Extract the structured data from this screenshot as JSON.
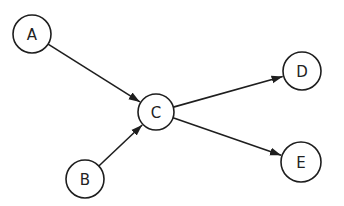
{
  "diagram": {
    "type": "directed-graph",
    "nodes": [
      {
        "id": "A",
        "label": "A",
        "x": 32,
        "y": 34,
        "r": 19
      },
      {
        "id": "B",
        "label": "B",
        "x": 85,
        "y": 179,
        "r": 19
      },
      {
        "id": "C",
        "label": "C",
        "x": 156,
        "y": 112,
        "r": 18
      },
      {
        "id": "D",
        "label": "D",
        "x": 302,
        "y": 71,
        "r": 19
      },
      {
        "id": "E",
        "label": "E",
        "x": 301,
        "y": 162,
        "r": 20
      }
    ],
    "edges": [
      {
        "from": "A",
        "to": "C"
      },
      {
        "from": "B",
        "to": "C"
      },
      {
        "from": "C",
        "to": "D"
      },
      {
        "from": "C",
        "to": "E"
      }
    ],
    "colors": {
      "stroke": "#1e1e1e",
      "background": "#ffffff"
    }
  }
}
